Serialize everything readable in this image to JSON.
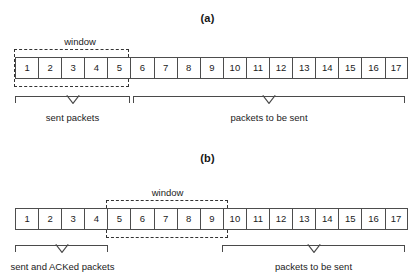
{
  "figure": {
    "panels": [
      {
        "id": "a",
        "caption": "(a)",
        "window_label": "window",
        "window_cells": [
          1,
          5
        ],
        "cells": [
          "1",
          "2",
          "3",
          "4",
          "5",
          "6",
          "7",
          "8",
          "9",
          "10",
          "11",
          "12",
          "13",
          "14",
          "15",
          "16",
          "17"
        ],
        "braces": [
          {
            "label": "sent packets",
            "span": [
              1,
              5
            ]
          },
          {
            "label": "packets to be sent",
            "span": [
              6,
              17
            ]
          }
        ]
      },
      {
        "id": "b",
        "caption": "(b)",
        "window_label": "window",
        "window_cells": [
          5,
          9
        ],
        "cells": [
          "1",
          "2",
          "3",
          "4",
          "5",
          "6",
          "7",
          "8",
          "9",
          "10",
          "11",
          "12",
          "13",
          "14",
          "15",
          "16",
          "17"
        ],
        "braces": [
          {
            "label": "sent and ACKed packets",
            "span": [
              1,
              4
            ]
          },
          {
            "label": "packets to be sent",
            "span": [
              10,
              17
            ]
          }
        ]
      }
    ],
    "colors": {
      "cell_border": "#4d4d4d",
      "window_border": "#333333",
      "brace_line": "#4a4a4a",
      "text": "#1b1b1b",
      "background": "#ffffff"
    }
  }
}
